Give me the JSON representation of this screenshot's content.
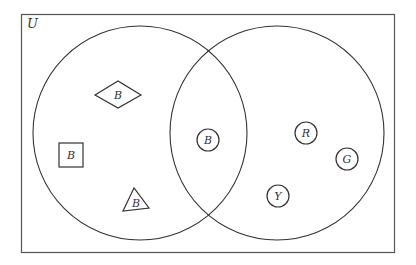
{
  "diagram": {
    "type": "venn",
    "universe_label": "U",
    "colors": {
      "stroke": "#333333",
      "background": "#ffffff"
    },
    "sets": [
      {
        "id": "left",
        "description": "left circle"
      },
      {
        "id": "right",
        "description": "right circle"
      }
    ],
    "elements": [
      {
        "shape": "diamond",
        "label": "B",
        "region": "left-only"
      },
      {
        "shape": "square",
        "label": "B",
        "region": "left-only"
      },
      {
        "shape": "triangle",
        "label": "B",
        "region": "left-only"
      },
      {
        "shape": "circle",
        "label": "B",
        "region": "intersection"
      },
      {
        "shape": "circle",
        "label": "R",
        "region": "right-only"
      },
      {
        "shape": "circle",
        "label": "G",
        "region": "right-only"
      },
      {
        "shape": "circle",
        "label": "Y",
        "region": "right-only"
      }
    ]
  }
}
